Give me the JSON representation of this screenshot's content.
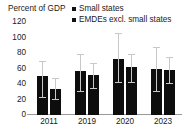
{
  "chart_data": {
    "type": "bar",
    "title": "",
    "ylabel": "Percent of GDP",
    "xlabel": "",
    "ylim": [
      0,
      120
    ],
    "yticks": [
      0,
      20,
      40,
      60,
      80,
      100,
      120
    ],
    "grid": false,
    "legend_position": "top-right",
    "categories": [
      "2011",
      "2019",
      "2020",
      "2023"
    ],
    "error_bars": true,
    "series": [
      {
        "name": "Small states",
        "color": "#0d0d0d",
        "values": [
          50,
          57,
          72,
          60
        ],
        "error_low": [
          22,
          30,
          41,
          30
        ],
        "error_high": [
          68,
          78,
          105,
          86
        ]
      },
      {
        "name": "EMDEs excl. small states",
        "color": "#0d0d0d",
        "values": [
          34,
          52,
          62,
          58
        ],
        "error_low": [
          20,
          33,
          41,
          40
        ],
        "error_high": [
          46,
          66,
          77,
          74
        ]
      }
    ]
  },
  "axis": {
    "unit_title": "Percent of GDP",
    "y_tick_labels": [
      "120",
      "100",
      "80",
      "60",
      "40",
      "20",
      "0"
    ],
    "x_tick_labels": [
      "2011",
      "2019",
      "2020",
      "2023"
    ]
  },
  "legend": {
    "items": [
      {
        "label": "Small states",
        "swatch_color": "#111111"
      },
      {
        "label": "EMDEs excl. small states",
        "swatch_color": "#111111"
      }
    ]
  }
}
